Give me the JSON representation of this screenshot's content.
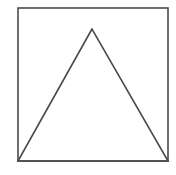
{
  "diagram": {
    "background": "#ffffff",
    "stroke_color": "#4a4a4a",
    "stroke_width": 1.6,
    "square": {
      "x": 18,
      "y": 8,
      "width": 150,
      "height": 153
    },
    "triangle": {
      "apex": {
        "x": 92,
        "y": 29
      },
      "left": {
        "x": 18,
        "y": 161
      },
      "right": {
        "x": 168,
        "y": 161
      }
    }
  }
}
